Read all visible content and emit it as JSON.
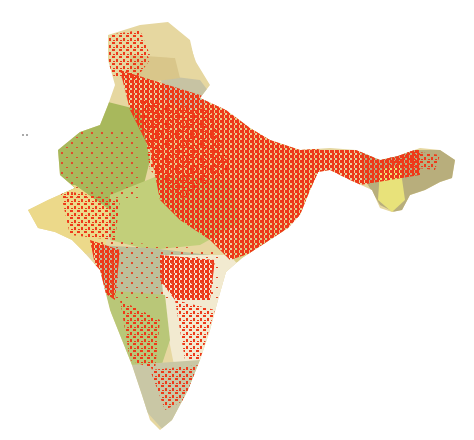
{
  "map": {
    "subject": "India",
    "labels": [],
    "colors": {
      "background": "#ffffff",
      "overlay_red": "#ee3a1a",
      "region_olive_green": "#a8b85c",
      "region_light_green": "#c2cf7a",
      "region_pale_yellow": "#ecd98a",
      "region_tan": "#d9c68a",
      "region_grey_green": "#bcbf9a",
      "region_cream": "#f2ead0",
      "region_khaki": "#b8ae7c"
    },
    "regions": [
      {
        "name": "jammu-kashmir-north",
        "color": "#e6d7a0"
      },
      {
        "name": "himachal",
        "color": "#d9c68a"
      },
      {
        "name": "uttarakhand",
        "color": "#c7c3a3"
      },
      {
        "name": "rajasthan",
        "color": "#a8b85c"
      },
      {
        "name": "gujarat",
        "color": "#ecd98a"
      },
      {
        "name": "madhya-pradesh",
        "color": "#c2cf7a"
      },
      {
        "name": "maharashtra",
        "color": "#bcbf9a"
      },
      {
        "name": "gangetic-plain",
        "color": "#e8cf8c"
      },
      {
        "name": "east",
        "color": "#ddd08a"
      },
      {
        "name": "telangana-andhra",
        "color": "#f2ead0"
      },
      {
        "name": "karnataka",
        "color": "#b9c778"
      },
      {
        "name": "south-tip",
        "color": "#c9c7a5"
      },
      {
        "name": "northeast",
        "color": "#b8ae7c"
      }
    ]
  }
}
